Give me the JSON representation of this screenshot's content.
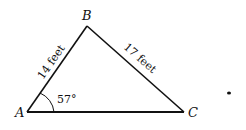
{
  "diagram": {
    "type": "triangle",
    "vertices": {
      "A": {
        "label": "A"
      },
      "B": {
        "label": "B"
      },
      "C": {
        "label": "C"
      }
    },
    "sides": {
      "AB": {
        "label": "14 feet"
      },
      "BC": {
        "label": "17 feet"
      }
    },
    "angles": {
      "A": {
        "label": "57°"
      }
    },
    "colors": {
      "stroke": "#111111",
      "background": "#ffffff"
    }
  }
}
